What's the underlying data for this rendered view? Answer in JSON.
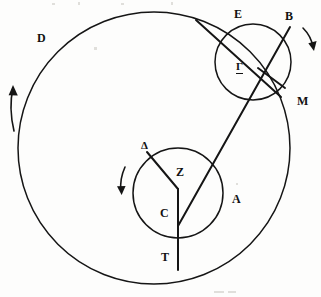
{
  "figure": {
    "type": "geometric-astronomical-diagram",
    "background_color": "#fdfdfc",
    "ink_color": "#151515",
    "width": 321,
    "height": 297
  },
  "labels": {
    "delta_deferent": "D",
    "epsilon": "E",
    "beta": "B",
    "gamma": "Γ",
    "mu": "M",
    "delta_small": "Δ",
    "zeta": "Z",
    "gamma_small": "C",
    "alpha": "A",
    "tau": "T"
  },
  "circles": [
    {
      "name": "deferent",
      "label": "D",
      "cx": 154,
      "cy": 148,
      "r": 136
    },
    {
      "name": "inner-circle",
      "label": "C",
      "cx": 178,
      "cy": 193,
      "r": 45
    },
    {
      "name": "epicycle",
      "label": "Γ",
      "cx": 253,
      "cy": 62,
      "r": 38
    }
  ],
  "arrows": [
    {
      "name": "deferent-rotation-arrow",
      "direction": "counterclockwise-upward",
      "position": "left-outside-deferent"
    },
    {
      "name": "inner-circle-rotation-arrow",
      "direction": "downward",
      "position": "left-of-inner-circle"
    },
    {
      "name": "epicycle-rotation-arrow",
      "direction": "downward",
      "position": "right-of-epicycle"
    }
  ],
  "segments": [
    {
      "name": "delta-to-zeta-radius",
      "from": "Δ",
      "to": "Z"
    },
    {
      "name": "zeta-to-tau-vertical",
      "from": "Z",
      "to": "T"
    },
    {
      "name": "tau-to-beta-diagonal",
      "from": "T",
      "to": "B"
    },
    {
      "name": "epsilon-to-mu-chord",
      "from": "E",
      "to": "M"
    },
    {
      "name": "gamma-to-mu-radius",
      "from": "Γ",
      "to": "M"
    }
  ]
}
